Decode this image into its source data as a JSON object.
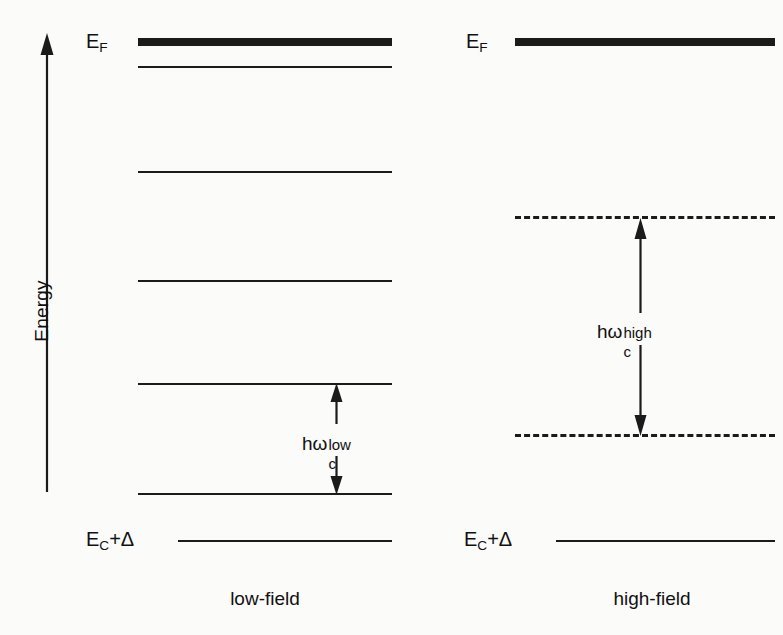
{
  "figure": {
    "background_color": "#fbfbfa",
    "ink_color": "#1b1b1b"
  },
  "axis": {
    "label": "Energy",
    "direction": "up",
    "arrow_icon": "up-arrow-icon"
  },
  "panels": [
    {
      "id": "low-field",
      "caption": "low-field",
      "fermi_label": "E",
      "fermi_label_sub": "F",
      "band_edge_label": "E",
      "band_edge_label_sub": "C",
      "band_edge_label_rest": "+Δ",
      "gap_label_base": "hω",
      "gap_label_sub": "c",
      "gap_label_sup": "low",
      "levels": [
        {
          "name": "fermi-level",
          "y": 42,
          "style": "thick-solid"
        },
        {
          "name": "landau-level-5",
          "y": 67,
          "style": "thin-solid"
        },
        {
          "name": "landau-level-4",
          "y": 172,
          "style": "thin-solid"
        },
        {
          "name": "landau-level-3",
          "y": 281,
          "style": "thin-solid"
        },
        {
          "name": "landau-level-2",
          "y": 384,
          "style": "thin-solid"
        },
        {
          "name": "landau-level-1",
          "y": 494,
          "style": "thin-solid"
        },
        {
          "name": "band-edge-level",
          "y": 541,
          "style": "thin-solid"
        }
      ],
      "transition": {
        "top_y": 384,
        "bottom_y": 494,
        "x": 336
      }
    },
    {
      "id": "high-field",
      "caption": "high-field",
      "fermi_label": "E",
      "fermi_label_sub": "F",
      "band_edge_label": "E",
      "band_edge_label_sub": "C",
      "band_edge_label_rest": "+Δ",
      "gap_label_base": "hω",
      "gap_label_sub": "c",
      "gap_label_sup": "high",
      "levels": [
        {
          "name": "fermi-level",
          "y": 42,
          "style": "thick-solid"
        },
        {
          "name": "landau-level-2",
          "y": 219,
          "style": "dashed"
        },
        {
          "name": "landau-level-1",
          "y": 437,
          "style": "dashed"
        },
        {
          "name": "band-edge-level",
          "y": 541,
          "style": "thin-solid"
        }
      ],
      "transition": {
        "top_y": 219,
        "bottom_y": 437,
        "x": 640
      }
    }
  ]
}
